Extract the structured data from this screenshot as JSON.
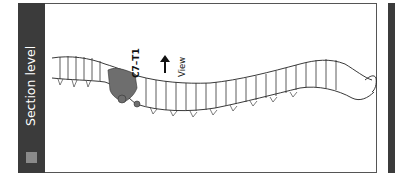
{
  "sidebar": {
    "title": "Section level",
    "legend_color": "#8a8a8a",
    "background": "#3b3b3b"
  },
  "figure": {
    "highlight_label": "C7–T1",
    "highlight_color": "#6e6e6e",
    "view_label": "View",
    "view_arrow": "left-arrow-icon"
  }
}
